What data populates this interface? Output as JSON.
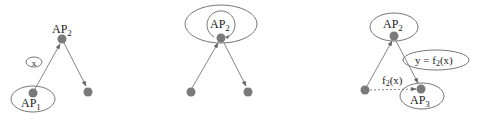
{
  "diagram": {
    "panels": [
      {
        "id": "panel-1",
        "nodes": [
          {
            "id": "ap2",
            "label_main": "AP",
            "label_sub": "2"
          },
          {
            "id": "ap1",
            "label_main": "AP",
            "label_sub": "1"
          },
          {
            "id": "leaf",
            "label_main": "",
            "label_sub": ""
          }
        ],
        "message": {
          "label": "x"
        },
        "edges": [
          {
            "from": "ap1",
            "to": "ap2",
            "style": "solid"
          },
          {
            "from": "ap2",
            "to": "leaf",
            "style": "solid"
          }
        ]
      },
      {
        "id": "panel-2",
        "nodes": [
          {
            "id": "ap2",
            "label_main": "AP",
            "label_sub": "2"
          },
          {
            "id": "left",
            "label_main": "",
            "label_sub": ""
          },
          {
            "id": "right",
            "label_main": "",
            "label_sub": ""
          }
        ],
        "edges": [
          {
            "from": "left",
            "to": "ap2",
            "style": "solid"
          },
          {
            "from": "ap2",
            "to": "right",
            "style": "solid"
          },
          {
            "from": "ap2",
            "to": "ap2",
            "style": "self-loop"
          }
        ]
      },
      {
        "id": "panel-3",
        "nodes": [
          {
            "id": "ap2",
            "label_main": "AP",
            "label_sub": "2"
          },
          {
            "id": "left",
            "label_main": "",
            "label_sub": ""
          },
          {
            "id": "ap3",
            "label_main": "AP",
            "label_sub": "3"
          }
        ],
        "result": {
          "lhs": "y = f",
          "sub": "2",
          "rhs": "(x)"
        },
        "edge_label": {
          "main": "f",
          "sub": "2",
          "rest": "(x)"
        },
        "edges": [
          {
            "from": "left",
            "to": "ap2",
            "style": "solid"
          },
          {
            "from": "ap2",
            "to": "ap3",
            "style": "solid"
          },
          {
            "from": "left",
            "to": "ap3",
            "style": "dashed"
          }
        ]
      }
    ],
    "colors": {
      "node": "#7a7a7a",
      "edge": "#777777",
      "text": "#222222",
      "background": "#ffffff"
    }
  }
}
